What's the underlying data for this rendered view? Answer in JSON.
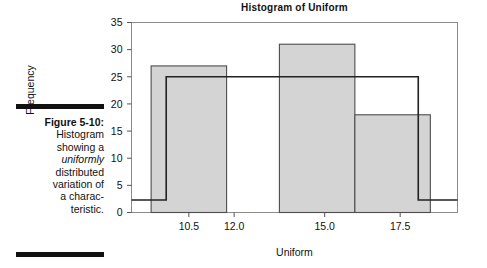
{
  "caption": {
    "figure_number": "Figure 5-10:",
    "line1": "Histogram",
    "line2": "showing a",
    "line3_em": "uniformly",
    "line4": "distributed",
    "line5": "variation of",
    "line6": "a charac-",
    "line7": "teristic."
  },
  "chart_data": {
    "type": "bar",
    "title": "Histogram of Uniform",
    "xlabel": "Uniform",
    "ylabel": "Frequency",
    "categories": [
      "9.25-11.75",
      "13.5-16.0",
      "16.0-18.5"
    ],
    "values": [
      27,
      31,
      18
    ],
    "bar_edges": [
      [
        9.25,
        11.75
      ],
      [
        13.5,
        16.0
      ],
      [
        16.0,
        18.5
      ]
    ],
    "bar_fill": "#d4d4d4",
    "bar_stroke": "#4d4d4d",
    "series": [
      {
        "name": "Histogram bars",
        "values": [
          27,
          31,
          18
        ]
      },
      {
        "name": "Uniform reference step line",
        "type": "step",
        "level": 25,
        "baseline": 2.3,
        "x_start": 9.75,
        "x_end": 18.1,
        "color": "#222222"
      }
    ],
    "ylim": [
      0,
      35
    ],
    "ytick_labels": [
      "0",
      "5",
      "10",
      "15",
      "20",
      "25",
      "30",
      "35"
    ],
    "ytick_values": [
      0,
      5,
      10,
      15,
      20,
      25,
      30,
      35
    ],
    "xtick_labels": [
      "10.5",
      "12.0",
      "15.0",
      "17.5"
    ],
    "xtick_values": [
      10.5,
      12.0,
      15.0,
      17.5
    ],
    "xlim": [
      8.6,
      19.4
    ],
    "grid": false,
    "legend": "none",
    "frame_color": "#7a7a7a"
  }
}
